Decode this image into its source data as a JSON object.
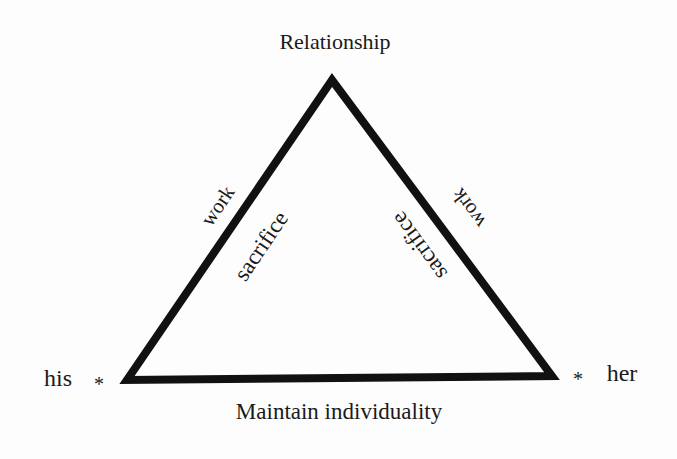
{
  "diagram": {
    "type": "triangle",
    "stroke_color": "#111111",
    "background_color": "#fdfdfd",
    "vertices": {
      "top": {
        "label": "Relationship"
      },
      "bottom_left": {
        "label": "his",
        "marker": "*"
      },
      "bottom_right": {
        "label": "her",
        "marker": "*"
      }
    },
    "edges": {
      "left": {
        "outer_label": "work",
        "inner_label": "sacrifice"
      },
      "right": {
        "outer_label": "work",
        "inner_label": "sacrifice"
      },
      "bottom": {
        "outer_label": "Maintain individuality"
      }
    }
  }
}
